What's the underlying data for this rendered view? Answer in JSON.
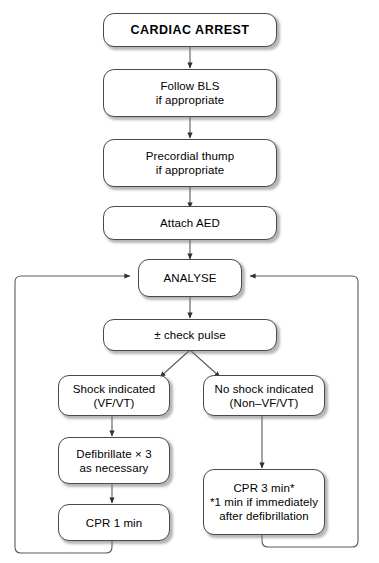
{
  "diagram": {
    "line_color": "#4a4a4a",
    "box_fill": "#ffffff",
    "text_color": "#000000"
  },
  "nodes": {
    "cardiac_arrest": {
      "label": "CARDIAC ARREST"
    },
    "follow_bls": {
      "line1": "Follow BLS",
      "line2": "if appropriate"
    },
    "precordial_thump": {
      "line1": "Precordial thump",
      "line2": "if appropriate"
    },
    "attach_aed": {
      "label": "Attach AED"
    },
    "analyse": {
      "label": "ANALYSE"
    },
    "check_pulse": {
      "label": "± check pulse"
    },
    "shock_indicated": {
      "line1": "Shock indicated",
      "line2": "(VF/VT)"
    },
    "no_shock_indicated": {
      "line1": "No shock indicated",
      "line2": "(Non–VF/VT)"
    },
    "defibrillate": {
      "line1": "Defibrillate × 3",
      "line2": "as necessary"
    },
    "cpr_1_min": {
      "label": "CPR 1 min"
    },
    "cpr_3_min": {
      "line1": "CPR 3 min*",
      "line2": "*1 min if immediately",
      "line3": "after defibrillation"
    }
  },
  "flow": {
    "branch_left_label": "shock indicated branch",
    "branch_right_label": "no shock indicated branch",
    "loop_left_label": "return to analyse from CPR 1 min",
    "loop_right_label": "return to analyse from CPR 3 min"
  }
}
